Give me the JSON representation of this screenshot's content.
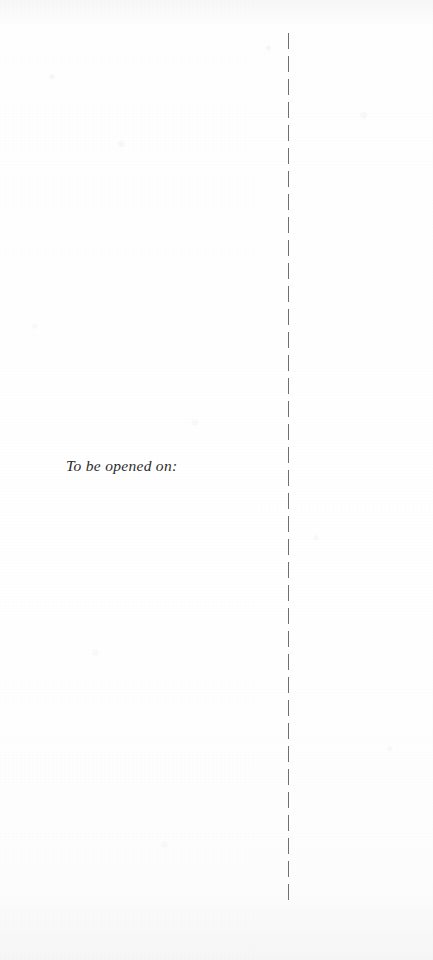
{
  "page": {
    "width": 433,
    "height": 960,
    "background_color": "#fefefe",
    "media": "scanned-card-inner-spread"
  },
  "fold_line": {
    "name": "dashed-fold-line",
    "orientation": "vertical",
    "color": "#6f6f71",
    "x": 288,
    "top": 33,
    "bottom": 900,
    "dash_length": 16,
    "gap_length": 7,
    "thickness": 1
  },
  "content": {
    "opened_on_label": "To be opened on:",
    "text_color": "#2b2b2d",
    "font_style": "italic-serif",
    "x": 66,
    "y": 456
  },
  "right_panel": {
    "content": ""
  }
}
